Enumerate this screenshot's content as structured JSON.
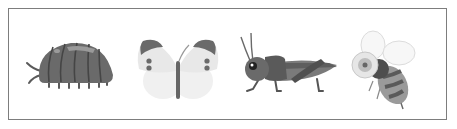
{
  "panel": {
    "insects": [
      {
        "name": "pill bug",
        "icon": "pill-bug-icon"
      },
      {
        "name": "butterfly",
        "icon": "butterfly-icon"
      },
      {
        "name": "grasshopper",
        "icon": "grasshopper-icon"
      },
      {
        "name": "bee",
        "icon": "bee-icon"
      }
    ],
    "colors": {
      "border": "#7d7d7d",
      "dark": "#5a5a5a",
      "mid": "#7a7a7a",
      "light": "#bdbdbd",
      "pale": "#ececec"
    }
  }
}
